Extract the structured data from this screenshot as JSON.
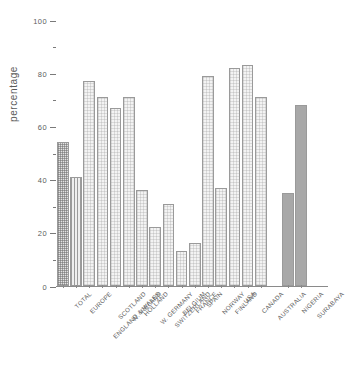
{
  "chart_data": {
    "type": "bar",
    "title": "",
    "xlabel": "",
    "ylabel": "percentage",
    "ylim": [
      0,
      100
    ],
    "ytick_labels": [
      "0",
      "20",
      "40",
      "60",
      "80",
      "100"
    ],
    "ytick_values": [
      0,
      20,
      40,
      60,
      80,
      100
    ],
    "yminor_values": [
      10,
      30,
      50,
      70,
      90
    ],
    "grid": false,
    "legend": "none",
    "categories": [
      "TOTAL",
      "EUROPE",
      "ENGLAND & WALES",
      "SCOTLAND",
      "N. IRELAND",
      "HOLLAND",
      "W. GERMANY",
      "SWITZERLAND",
      "BELGIUM",
      "FRANCE",
      "SPAIN",
      "NORWAY",
      "FINLAND",
      "USA",
      "CANADA",
      "AUSTRALIA",
      "NIGERIA",
      "SURABAYA"
    ],
    "values": [
      54,
      41,
      77,
      71,
      67,
      71,
      36,
      22,
      31,
      13,
      16,
      79,
      37,
      82,
      83,
      71,
      35,
      68
    ],
    "bar_styles": [
      "check",
      "stripe",
      "light",
      "light",
      "light",
      "light",
      "light",
      "light",
      "light",
      "light",
      "light",
      "light",
      "light",
      "light",
      "light",
      "light",
      "solid",
      "solid"
    ],
    "group_break_after_index": 15,
    "colors": {
      "axis": "#8a8a8a",
      "text": "#5d5d5d",
      "bar_outline": "#9a9a9a",
      "bar_light": "#f3f3f3",
      "bar_solid": "#a8a8a8"
    }
  }
}
